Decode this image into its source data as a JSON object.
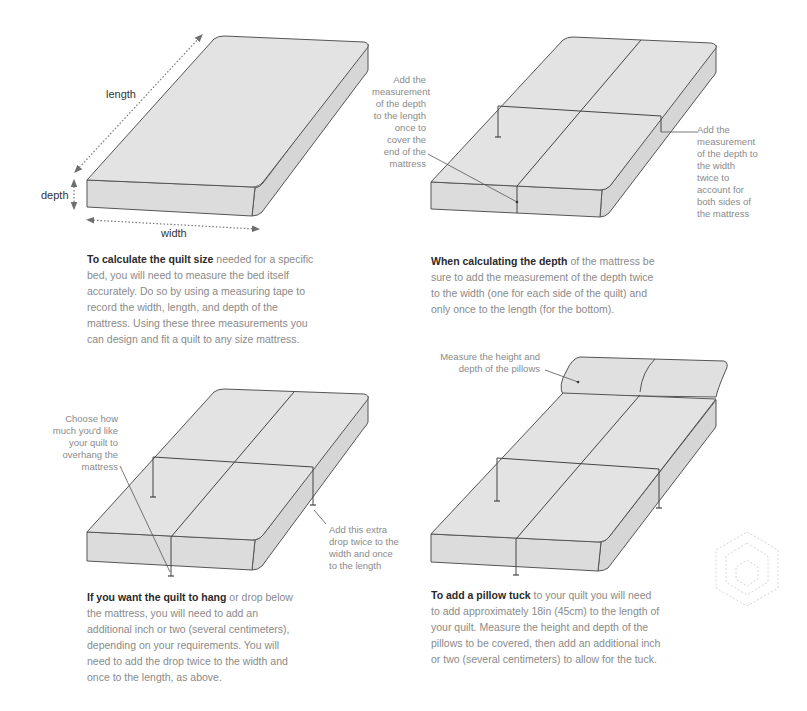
{
  "colors": {
    "mattress_fill": "#e2e2e2",
    "mattress_side": "#dadada",
    "outline": "#555555",
    "arrow": "#777777",
    "body_text": "#8a8a8a",
    "bold_text": "#2a2a2a"
  },
  "panel1": {
    "labels": {
      "length": "length",
      "depth": "depth",
      "width": "width"
    },
    "caption": {
      "bold": "To calculate the quilt size",
      "text": " needed for a specific bed, you will need to measure the bed itself accurately. Do so by using a measuring tape to record the width, length, and depth of the mattress. Using these three measurements you can design and fit a quilt to any size mattress."
    }
  },
  "panel2": {
    "note_left": "Add the measurement of the depth to the length once to cover the end of the mattress",
    "note_right": "Add the measurement of the depth to the width twice to account for both sides of the mattress",
    "caption": {
      "bold": "When calculating the depth",
      "text": " of the mattress be sure to add the measurement of the depth twice to the width (one for each side of the quilt) and only once to the length (for the bottom)."
    }
  },
  "panel3": {
    "note_left": "Choose how much you'd like your quilt to overhang the mattress",
    "note_right": "Add this extra drop twice to the width and once to the length",
    "caption": {
      "bold": "If you want the quilt to hang",
      "text": " or drop below the mattress, you will need to add an additional inch or two (several centimeters), depending on your requirements. You will need to add the drop twice to the width and once to the length, as above."
    }
  },
  "panel4": {
    "note_top": "Measure the height and depth of the pillows",
    "caption": {
      "bold": "To add a pillow tuck",
      "text": " to your quilt you will need to add approximately 18in (45cm) to the length of your quilt. Measure the height and depth of the pillows to be covered, then add an additional inch or two (several centimeters) to allow for the tuck."
    }
  },
  "decoration": {
    "icon": "dashed-hexagon-icon"
  }
}
